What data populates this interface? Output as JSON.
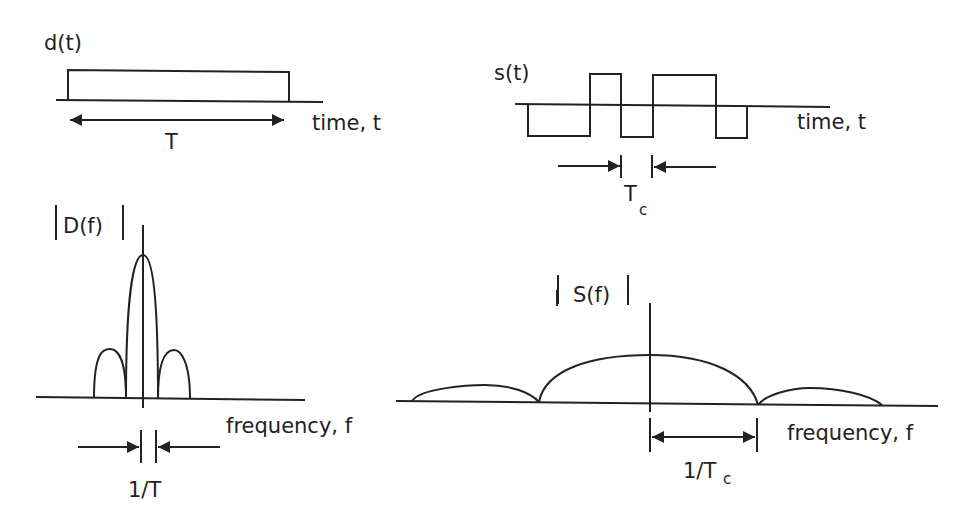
{
  "panels": {
    "data_time": {
      "ylabel": "d(t)",
      "xlabel": "time, t",
      "duration_label": "T"
    },
    "spread_time": {
      "ylabel": "s(t)",
      "xlabel": "time, t",
      "chip_label": "T",
      "chip_sub": "c"
    },
    "data_freq": {
      "ylabel": "D(f)",
      "xlabel": "frequency, f",
      "width_label": "1/T"
    },
    "spread_freq": {
      "ylabel": "S(f)",
      "xlabel": "frequency, f",
      "width_label": "1/T",
      "width_sub": "c"
    }
  },
  "colors": {
    "ink": "#222222",
    "background": "#ffffff"
  }
}
